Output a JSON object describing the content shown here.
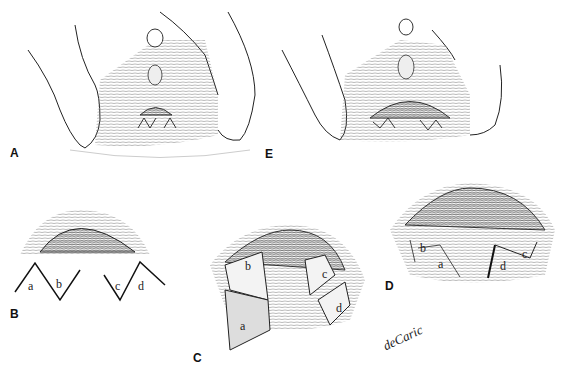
{
  "figure": {
    "type": "medical line illustration",
    "panels": [
      {
        "id": "A",
        "label": "A",
        "description": "perineal view with V-shaped incisions outlined below introitus"
      },
      {
        "id": "E",
        "label": "E",
        "description": "perineal view after closure with sutured zigzag line"
      },
      {
        "id": "B",
        "label": "B",
        "description": "two V incisions forming flaps a, b, c, d"
      },
      {
        "id": "C",
        "label": "C",
        "description": "flaps a, b, c, d raised and transposed"
      },
      {
        "id": "D",
        "label": "D",
        "description": "flaps sutured in new positions"
      }
    ],
    "flap_letters": [
      "a",
      "b",
      "c",
      "d"
    ],
    "signature": "deCaric"
  }
}
